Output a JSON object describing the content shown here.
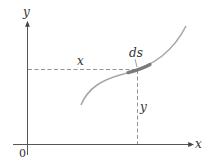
{
  "diagram": {
    "type": "arc-length-element",
    "labels": {
      "y_axis": "y",
      "x_axis": "x",
      "origin": "0",
      "x_distance": "x",
      "y_distance": "y",
      "arc_element": "ds"
    },
    "colors": {
      "axis": "#555555",
      "curve": "#a8a8a8",
      "ds_highlight": "#7a7a7a",
      "dashed": "#777777",
      "text": "#333333"
    }
  }
}
